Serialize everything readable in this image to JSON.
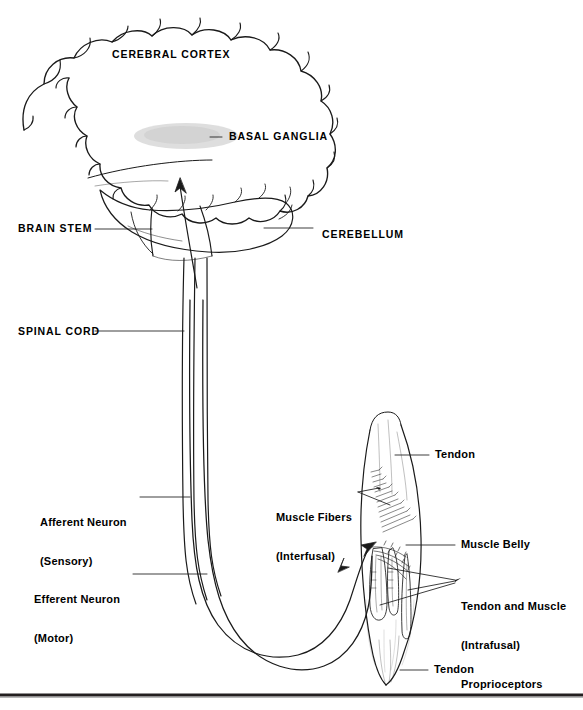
{
  "figure": {
    "type": "anatomical-line-diagram",
    "background_color": "#ffffff",
    "ink_color": "#1a1a1a",
    "shading_color": "#d8d8d8",
    "bottom_rule_color": "#231f20"
  },
  "labels": {
    "cerebral_cortex": "CEREBRAL CORTEX",
    "basal_ganglia": "BASAL GANGLIA",
    "brain_stem": "BRAIN STEM",
    "cerebellum": "CEREBELLUM",
    "spinal_cord": "SPINAL CORD",
    "afferent_line1": "Afferent Neuron",
    "afferent_line2": "(Sensory)",
    "efferent_line1": "Efferent Neuron",
    "efferent_line2": "(Motor)",
    "tendon_top": "Tendon",
    "tendon_bottom": "Tendon",
    "muscle_fibers_line1": "Muscle Fibers",
    "muscle_fibers_line2": "(Interfusal)",
    "muscle_belly": "Muscle Belly",
    "proprioceptors_line1": "Tendon and Muscle",
    "proprioceptors_line2": "(Intrafusal)",
    "proprioceptors_line3": "Proprioceptors"
  },
  "structures": {
    "brain": "cerebral hemisphere outline with gyri",
    "basal_ganglia_blob": "grey shaded oval inside hemisphere",
    "cerebellum": "lobed structure below occipital region",
    "brain_stem": "descending stalk continuous with spinal cord",
    "spinal_cord": "long vertical tract of paired lines",
    "muscle": "spindle-shaped muscle belly with tendons at both ends",
    "spindle_receptors": "intrafusal fibre organs inside muscle belly",
    "nerve_loop": "afferent and efferent fibres looping from cord to muscle"
  }
}
